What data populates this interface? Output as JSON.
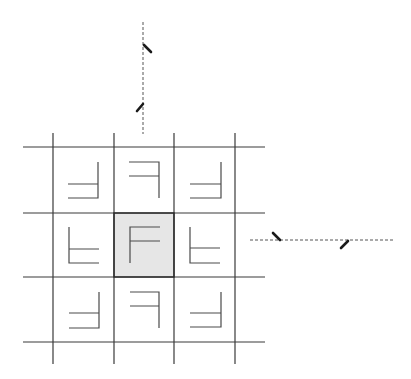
{
  "diagram": {
    "colors": {
      "background": "#ffffff",
      "grid": "#3a3a3a",
      "glyph": "#4a4a4a",
      "center_fill": "#e6e6e6",
      "axis": "#555555",
      "tick": "#1a1a1a"
    },
    "grid": {
      "vertical_x": [
        53,
        114,
        174,
        235
      ],
      "horizontal_y": [
        147,
        213,
        277,
        342
      ],
      "x_extent": [
        23,
        265
      ],
      "y_extent": [
        133,
        364
      ]
    },
    "center_cell": {
      "label": "F",
      "x": 114,
      "y": 213,
      "w": 60,
      "h": 64,
      "shaded": true
    },
    "cells": [
      {
        "row": 0,
        "col": 0,
        "orientation": "rotated-180-mirrored"
      },
      {
        "row": 0,
        "col": 1,
        "orientation": "mirrored-horizontal"
      },
      {
        "row": 0,
        "col": 2,
        "orientation": "rotated-180-mirrored"
      },
      {
        "row": 1,
        "col": 0,
        "orientation": "mirrored-vertical"
      },
      {
        "row": 1,
        "col": 1,
        "orientation": "original"
      },
      {
        "row": 1,
        "col": 2,
        "orientation": "mirrored-vertical"
      },
      {
        "row": 2,
        "col": 0,
        "orientation": "rotated-180-mirrored"
      },
      {
        "row": 2,
        "col": 1,
        "orientation": "mirrored-horizontal"
      },
      {
        "row": 2,
        "col": 2,
        "orientation": "rotated-180-mirrored"
      }
    ],
    "axes": [
      {
        "name": "vertical-axis",
        "x1": 143,
        "y1": 22,
        "x2": 143,
        "y2": 134,
        "ticks": 2
      },
      {
        "name": "horizontal-axis",
        "x1": 250,
        "y1": 240,
        "x2": 394,
        "y2": 240,
        "ticks": 2
      }
    ]
  }
}
